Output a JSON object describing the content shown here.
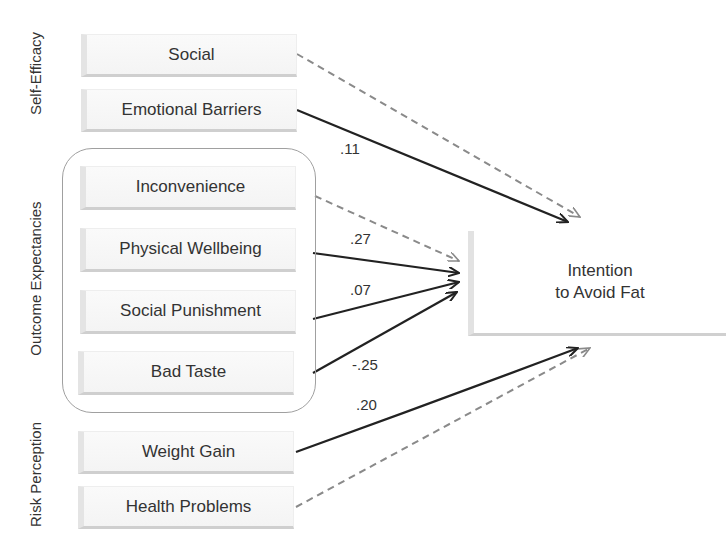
{
  "groups": {
    "self_efficacy": {
      "label": "Self-Efficacy",
      "items": [
        "Social",
        "Emotional Barriers"
      ]
    },
    "outcome_expectancies": {
      "label": "Outcome  Expectancies",
      "items": [
        "Inconvenience",
        "Physical Wellbeing",
        "Social Punishment",
        "Bad Taste"
      ]
    },
    "risk_perception": {
      "label": "Risk Perception",
      "items": [
        "Weight Gain",
        "Health Problems"
      ]
    }
  },
  "target": {
    "line1": "Intention",
    "line2": "to Avoid  Fat"
  },
  "paths": [
    {
      "from": "Social",
      "to": "Intention to Avoid Fat",
      "style": "dashed",
      "coefficient": ""
    },
    {
      "from": "Emotional Barriers",
      "to": "Intention to Avoid Fat",
      "style": "solid",
      "coefficient": ".11"
    },
    {
      "from": "Inconvenience",
      "to": "Intention to Avoid Fat",
      "style": "dashed",
      "coefficient": ""
    },
    {
      "from": "Physical Wellbeing",
      "to": "Intention to Avoid Fat",
      "style": "solid",
      "coefficient": ".27"
    },
    {
      "from": "Social Punishment",
      "to": "Intention to Avoid Fat",
      "style": "solid",
      "coefficient": ".07"
    },
    {
      "from": "Bad Taste",
      "to": "Intention to Avoid Fat",
      "style": "solid",
      "coefficient": "-.25"
    },
    {
      "from": "Weight Gain",
      "to": "Intention to Avoid Fat",
      "style": "solid",
      "coefficient": ".20"
    },
    {
      "from": "Health Problems",
      "to": "Intention to Avoid Fat",
      "style": "dashed",
      "coefficient": ""
    }
  ],
  "colors": {
    "solid": "#222222",
    "dashed": "#8a8a8a",
    "group_border": "#a0a0a0"
  }
}
